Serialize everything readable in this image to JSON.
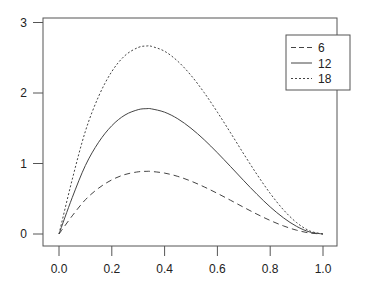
{
  "chart_data": {
    "type": "line",
    "title": "",
    "xlabel": "",
    "ylabel": "",
    "xlim": [
      0,
      1
    ],
    "ylim": [
      0,
      3
    ],
    "x_ticks": [
      "0.0",
      "0.2",
      "0.4",
      "0.6",
      "0.8",
      "1.0"
    ],
    "y_ticks": [
      "0",
      "1",
      "2",
      "3"
    ],
    "grid": false,
    "legend_position": "top-right",
    "x": [
      0.0,
      0.05,
      0.1,
      0.15,
      0.2,
      0.25,
      0.3,
      0.333,
      0.35,
      0.4,
      0.45,
      0.5,
      0.55,
      0.6,
      0.65,
      0.7,
      0.75,
      0.8,
      0.85,
      0.9,
      0.95,
      1.0
    ],
    "series": [
      {
        "name": "6",
        "style": "dashed",
        "values": [
          0.0,
          0.257,
          0.486,
          0.65,
          0.768,
          0.844,
          0.882,
          0.889,
          0.887,
          0.864,
          0.817,
          0.75,
          0.668,
          0.576,
          0.478,
          0.378,
          0.281,
          0.192,
          0.115,
          0.054,
          0.014,
          0.0
        ]
      },
      {
        "name": "12",
        "style": "solid",
        "values": [
          0.0,
          0.515,
          0.972,
          1.301,
          1.536,
          1.688,
          1.764,
          1.778,
          1.775,
          1.728,
          1.634,
          1.5,
          1.337,
          1.152,
          0.956,
          0.756,
          0.563,
          0.384,
          0.23,
          0.108,
          0.028,
          0.0
        ]
      },
      {
        "name": "18",
        "style": "dotted",
        "values": [
          0.0,
          0.772,
          1.458,
          1.951,
          2.304,
          2.531,
          2.646,
          2.667,
          2.662,
          2.592,
          2.45,
          2.25,
          2.005,
          1.728,
          1.434,
          1.134,
          0.844,
          0.576,
          0.344,
          0.162,
          0.043,
          0.0
        ]
      }
    ]
  },
  "legend": {
    "items": [
      {
        "label": "6"
      },
      {
        "label": "12"
      },
      {
        "label": "18"
      }
    ]
  },
  "colors": {
    "line": "#444444",
    "axis": "#555555"
  }
}
